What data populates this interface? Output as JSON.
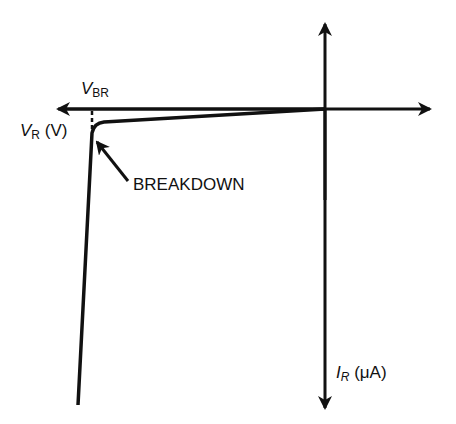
{
  "diagram": {
    "labels": {
      "vbr_main": "V",
      "vbr_sub": "BR",
      "vr_main": "V",
      "vr_sub": "R",
      "vr_unit": " (V)",
      "ir_main": "I",
      "ir_sub": "R",
      "ir_unit": " (μA)",
      "breakdown": "BREAKDOWN"
    },
    "colors": {
      "line": "#111111",
      "background": "#ffffff"
    }
  }
}
